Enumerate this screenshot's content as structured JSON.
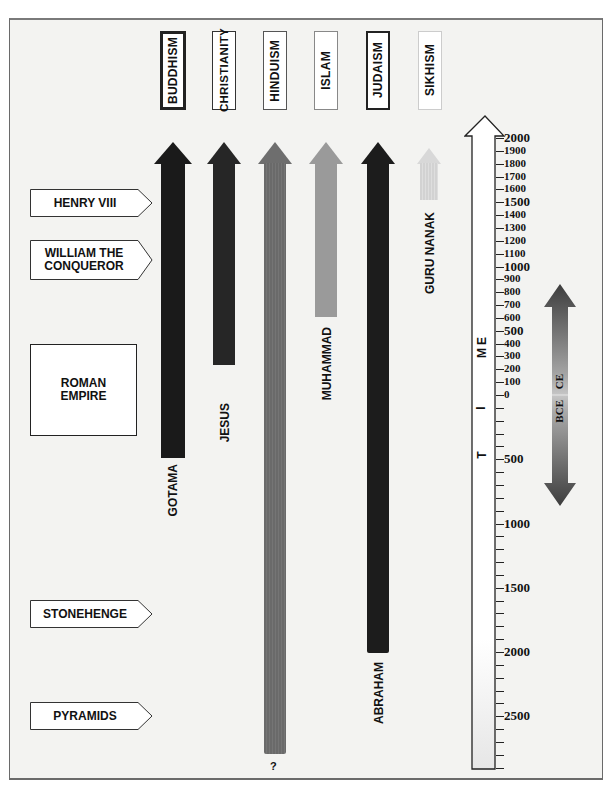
{
  "diagram": {
    "type": "timeline",
    "timeline_axis": {
      "label": "TIME",
      "letters": [
        "T",
        "I",
        "M",
        "E"
      ],
      "ce_ticks": [
        2000,
        1900,
        1800,
        1700,
        1600,
        1500,
        1400,
        1300,
        1200,
        1100,
        1000,
        900,
        800,
        700,
        600,
        500,
        400,
        300,
        200,
        100,
        0
      ],
      "bce_ticks": [
        500,
        1000,
        1500,
        2000,
        2500
      ],
      "major_labels": [
        "2000",
        "1500",
        "1000",
        "500",
        "0"
      ]
    },
    "era_arrow": {
      "up_label": "CE",
      "down_label": "BCE"
    },
    "religions": [
      {
        "name": "BUDDHISM",
        "founder": "GOTAMA",
        "start": -500,
        "color": "#1a1a1a",
        "bold_box": true
      },
      {
        "name": "CHRISTIANITY",
        "founder": "JESUS",
        "start": 30,
        "color": "#262626",
        "bold_box": false
      },
      {
        "name": "HINDUISM",
        "founder": "?",
        "start": -2900,
        "color": "#6e6e6e",
        "bold_box": false
      },
      {
        "name": "ISLAM",
        "founder": "MUHAMMAD",
        "start": 610,
        "color": "#9a9a9a",
        "bold_box": false
      },
      {
        "name": "JUDAISM",
        "founder": "ABRAHAM",
        "start": -1950,
        "color": "#1c1c1c",
        "bold_box": false
      },
      {
        "name": "SIKHISM",
        "founder": "GURU NANAK",
        "start": 1500,
        "color": "#d8d8d8",
        "bold_box": false
      }
    ],
    "events": [
      {
        "label": "HENRY VIII",
        "lines": [
          "HENRY VIII"
        ]
      },
      {
        "label": "WILLIAM THE CONQUEROR",
        "lines": [
          "WILLIAM THE",
          "CONQUEROR"
        ]
      },
      {
        "label": "ROMAN EMPIRE",
        "lines": [
          "ROMAN",
          "EMPIRE"
        ]
      },
      {
        "label": "STONEHENGE",
        "lines": [
          "STONEHENGE"
        ]
      },
      {
        "label": "PYRAMIDS",
        "lines": [
          "PYRAMIDS"
        ]
      }
    ]
  }
}
